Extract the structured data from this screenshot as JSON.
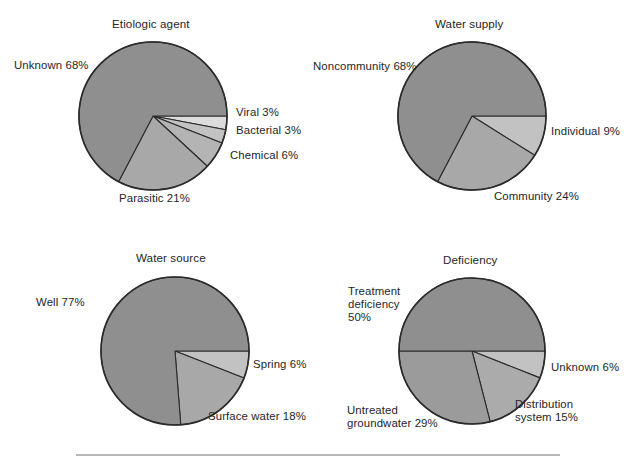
{
  "figure": {
    "title": "",
    "background_color": "#ffffff",
    "slice_colors": {
      "dark_gray": "#8f8f8f",
      "mid_gray": "#a8a8a8",
      "light_gray": "#c2c2c2",
      "pale_gray": "#dcdcdc",
      "outline": "#2b2b2b"
    },
    "rule_color": "#b9b9bb"
  },
  "chart_data": [
    {
      "type": "pie",
      "title": "Etiologic agent",
      "name": "etiologic-agent",
      "center": [
        153,
        116
      ],
      "radius": 74,
      "start_angle_deg": 90,
      "direction": "clockwise",
      "categories": [
        "Viral",
        "Bacterial",
        "Chemical",
        "Parasitic",
        "Unknown"
      ],
      "values": [
        3,
        3,
        6,
        21,
        68
      ],
      "labels": [
        "Viral 3%",
        "Bacterial 3%",
        "Chemical 6%",
        "Parasitic 21%",
        "Unknown 68%"
      ],
      "colors": [
        "#dcdcdc",
        "#c2c2c2",
        "#b4b4b4",
        "#a8a8a8",
        "#8f8f8f"
      ],
      "label_positions": [
        {
          "x": 236,
          "y": 106,
          "align": "left"
        },
        {
          "x": 236,
          "y": 124,
          "align": "left"
        },
        {
          "x": 230,
          "y": 149,
          "align": "left"
        },
        {
          "x": 119,
          "y": 192,
          "align": "left"
        },
        {
          "x": 14,
          "y": 59,
          "align": "left"
        }
      ],
      "title_position": {
        "x": 112,
        "y": 17
      }
    },
    {
      "type": "pie",
      "title": "Water supply",
      "name": "water-supply",
      "center": [
        472,
        116
      ],
      "radius": 74,
      "start_angle_deg": 90,
      "direction": "clockwise",
      "categories": [
        "Individual",
        "Community",
        "Noncommunity"
      ],
      "values": [
        9,
        24,
        68
      ],
      "labels": [
        "Individual 9%",
        "Community 24%",
        "Noncommunity 68%"
      ],
      "colors": [
        "#c2c2c2",
        "#a8a8a8",
        "#8f8f8f"
      ],
      "label_positions": [
        {
          "x": 551,
          "y": 125,
          "align": "left"
        },
        {
          "x": 494,
          "y": 190,
          "align": "left"
        },
        {
          "x": 313,
          "y": 60,
          "align": "left"
        }
      ],
      "title_position": {
        "x": 435,
        "y": 17
      }
    },
    {
      "type": "pie",
      "title": "Water source",
      "name": "water-source",
      "center": [
        175,
        351
      ],
      "radius": 74,
      "start_angle_deg": 90,
      "direction": "clockwise",
      "categories": [
        "Spring",
        "Surface water",
        "Well"
      ],
      "values": [
        6,
        18,
        77
      ],
      "labels": [
        "Spring 6%",
        "Surface water 18%",
        "Well 77%"
      ],
      "colors": [
        "#c2c2c2",
        "#a8a8a8",
        "#8f8f8f"
      ],
      "label_positions": [
        {
          "x": 253,
          "y": 358,
          "align": "left"
        },
        {
          "x": 208,
          "y": 410,
          "align": "left"
        },
        {
          "x": 36,
          "y": 296,
          "align": "left"
        }
      ],
      "title_position": {
        "x": 136,
        "y": 251
      }
    },
    {
      "type": "pie",
      "title": "Deficiency",
      "name": "deficiency",
      "center": [
        472,
        351
      ],
      "radius": 73,
      "start_angle_deg": 90,
      "direction": "clockwise",
      "categories": [
        "Unknown",
        "Distribution system",
        "Untreated groundwater",
        "Treatment deficiency"
      ],
      "values": [
        6,
        15,
        29,
        50
      ],
      "labels": [
        "Unknown 6%",
        "Distribution system 15%",
        "Untreated groundwater 29%",
        "Treatment deficiency 50%"
      ],
      "colors": [
        "#c2c2c2",
        "#ababab",
        "#9b9b9b",
        "#8f8f8f"
      ],
      "label_lines": [
        [
          "Unknown 6%"
        ],
        [
          "Distribution",
          "system 15%"
        ],
        [
          "Untreated",
          "groundwater 29%"
        ],
        [
          "Treatment",
          "deficiency",
          "50%"
        ]
      ],
      "label_positions": [
        {
          "x": 551,
          "y": 361,
          "align": "left"
        },
        {
          "x": 515,
          "y": 398,
          "align": "left"
        },
        {
          "x": 347,
          "y": 404,
          "align": "left"
        },
        {
          "x": 348,
          "y": 285,
          "align": "left"
        }
      ],
      "title_position": {
        "x": 443,
        "y": 253
      }
    }
  ]
}
